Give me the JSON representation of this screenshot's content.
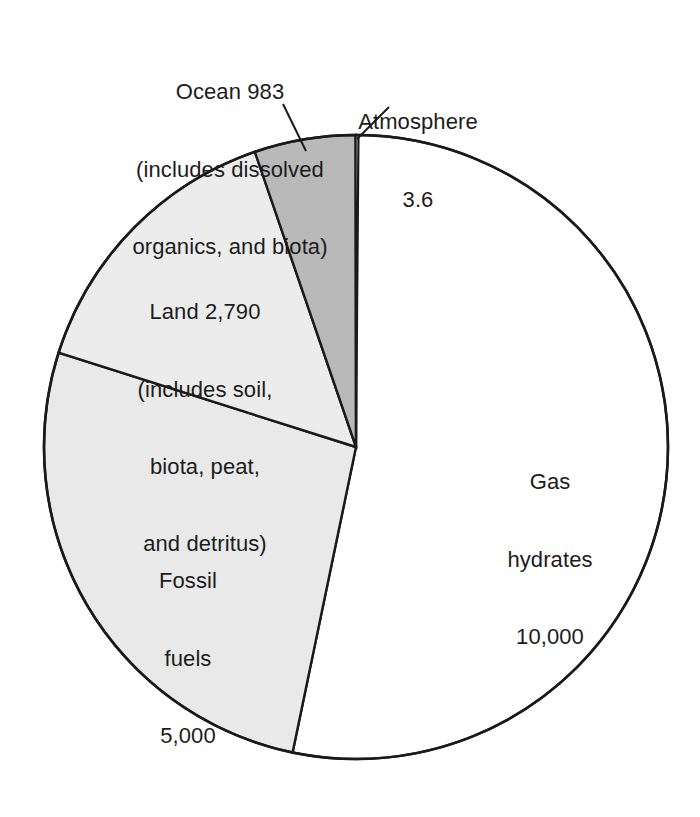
{
  "figure": {
    "name": "global-carbon-reservoirs-pie-chart",
    "background_color": "#ffffff",
    "outline_color": "#1a1a1a"
  },
  "labels": {
    "ocean": {
      "line1": "Ocean 983",
      "line2": "(includes dissolved",
      "line3": "organics, and biota)"
    },
    "atmosphere": {
      "line1": "Atmosphere",
      "line2": "3.6"
    },
    "land": {
      "line1": "Land 2,790",
      "line2": "(includes soil,",
      "line3": "biota, peat,",
      "line4": "and detritus)"
    },
    "fossil": {
      "line1": "Fossil",
      "line2": "fuels",
      "line3": "5,000"
    },
    "gas": {
      "line1": "Gas",
      "line2": "hydrates",
      "line3": "10,000"
    }
  },
  "chart_data": {
    "type": "pie",
    "title": "",
    "subtitle": "",
    "xlabel": "",
    "ylabel": "",
    "unit": "gigatons of carbon",
    "total": 18776.6,
    "legend_position": "callout-labels",
    "grid": false,
    "start_angle_deg": 0,
    "direction": "clockwise",
    "categories": [
      "Gas hydrates",
      "Fossil fuels",
      "Land",
      "Ocean",
      "Atmosphere"
    ],
    "values": [
      10000,
      5000,
      2790,
      983,
      3.6
    ],
    "value_labels": [
      "10,000",
      "5,000",
      "2,790",
      "983",
      "3.6"
    ],
    "percentages": [
      53.3,
      26.6,
      14.9,
      5.2,
      0.02
    ],
    "slice_colors": [
      "#ffffff",
      "#e9e9e9",
      "#ececec",
      "#b9b9b9",
      "#ffffff"
    ],
    "annotations": [
      "Ocean 983 (includes dissolved organics, and biota)",
      "Land 2,790 (includes soil, biota, peat, and detritus)",
      "Atmosphere 3.6",
      "Fossil fuels 5,000",
      "Gas hydrates 10,000"
    ],
    "slices": [
      {
        "name": "Gas hydrates",
        "value": 10000,
        "value_label": "10,000",
        "percent": 53.3,
        "color": "#ffffff"
      },
      {
        "name": "Fossil fuels",
        "value": 5000,
        "value_label": "5,000",
        "percent": 26.6,
        "color": "#e9e9e9"
      },
      {
        "name": "Land",
        "value": 2790,
        "value_label": "2,790",
        "percent": 14.9,
        "color": "#ececec"
      },
      {
        "name": "Ocean",
        "value": 983,
        "value_label": "983",
        "percent": 5.2,
        "color": "#b9b9b9"
      },
      {
        "name": "Atmosphere",
        "value": 3.6,
        "value_label": "3.6",
        "percent": 0.02,
        "color": "#ffffff"
      }
    ]
  }
}
